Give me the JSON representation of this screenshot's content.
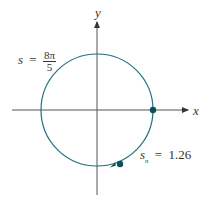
{
  "diagram": {
    "axes": {
      "x_label": "x",
      "y_label": "y"
    },
    "circle": {
      "type": "unit circle",
      "color": "#1f6f80"
    },
    "labels": {
      "s_label": {
        "var": "s",
        "eq": "=",
        "numerator": "8π",
        "denominator": "5"
      },
      "sn_label": {
        "var": "s",
        "sub": "n",
        "eq": "=",
        "value": "1.26"
      }
    },
    "points": [
      {
        "name": "start-point",
        "on": "positive x-axis"
      },
      {
        "name": "s-n-point",
        "value": "1.26"
      }
    ],
    "colors": {
      "curve": "#1f6f80",
      "point": "#0f4f5c",
      "axes": "#333333"
    }
  }
}
